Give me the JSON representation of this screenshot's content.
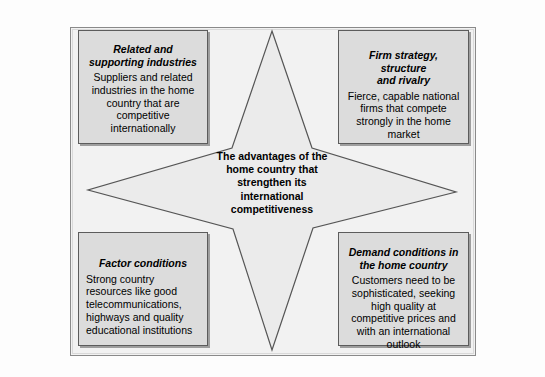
{
  "diagram": {
    "colors": {
      "background": "#fdfdfd",
      "frame_fill": "#f2f2f2",
      "frame_border": "#8a8a8a",
      "box_fill": "#dcdcdc",
      "box_border": "#5c5c5c",
      "star_fill": "#ebebeb",
      "star_border": "#555555",
      "text": "#000000"
    },
    "center": {
      "text": "The advantages of the\nhome country that\nstrengthen its\ninternational\ncompetitiveness"
    },
    "boxes": [
      {
        "id": "related-supporting-industries",
        "position": "top-left",
        "title": "Related and\nsupporting industries",
        "body": "Suppliers and related\nindustries in the home\ncountry that are\ncompetitive\ninternationally",
        "body_align": "center"
      },
      {
        "id": "firm-strategy-structure-rivalry",
        "position": "top-right",
        "title": "Firm strategy, structure\nand rivalry",
        "body": "Fierce, capable national\nfirms that compete\nstrongly in the home\nmarket",
        "body_align": "center"
      },
      {
        "id": "factor-conditions",
        "position": "bottom-left",
        "title": "Factor conditions",
        "body": "Strong country\nresources like good\ntelecommunications,\nhighways and quality\neducational institutions",
        "body_align": "left"
      },
      {
        "id": "demand-conditions",
        "position": "bottom-right",
        "title": "Demand conditions in\nthe home country",
        "body": "Customers need to be\nsophisticated, seeking\nhigh quality at\ncompetitive prices and\nwith an international\noutlook",
        "body_align": "center"
      }
    ],
    "star": {
      "shape": "four-pointed-star",
      "points": {
        "top": [
          272,
          31
        ],
        "right": [
          456,
          192
        ],
        "bottom": [
          272,
          350
        ],
        "left": [
          88,
          190
        ]
      },
      "inner_points": {
        "top_right": [
          312,
          148
        ],
        "bottom_right": [
          313,
          228
        ],
        "bottom_left": [
          233,
          229
        ],
        "top_left": [
          232,
          148
        ]
      }
    }
  }
}
